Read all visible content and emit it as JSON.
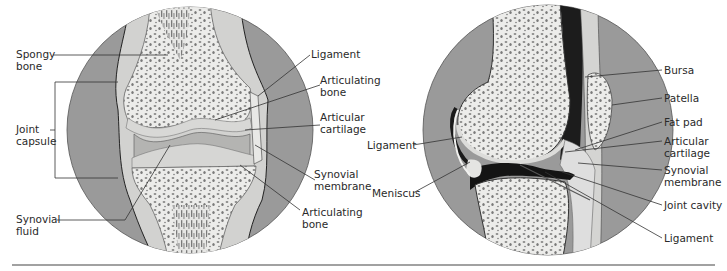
{
  "figure": {
    "left_panel": {
      "title": "Frontal view of synovial joint",
      "labels": {
        "spongy_bone": [
          "Spongy",
          "bone"
        ],
        "joint_capsule": [
          "Joint",
          "capsule"
        ],
        "synovial_fluid": [
          "Synovial",
          "fluid"
        ],
        "ligament": [
          "Ligament"
        ],
        "articulating_bone_top": [
          "Articulating",
          "bone"
        ],
        "articular_cartilage": [
          "Articular",
          "cartilage"
        ],
        "synovial_membrane": [
          "Synovial",
          "membrane"
        ],
        "articulating_bone_bottom": [
          "Articulating",
          "bone"
        ]
      }
    },
    "right_panel": {
      "title": "Sagittal view of knee joint",
      "labels": {
        "ligament_left": [
          "Ligament"
        ],
        "meniscus": [
          "Meniscus"
        ],
        "bursa": [
          "Bursa"
        ],
        "patella": [
          "Patella"
        ],
        "fat_pad": [
          "Fat pad"
        ],
        "articular_cartilage": [
          "Articular",
          "cartilage"
        ],
        "synovial_membrane": [
          "Synovial",
          "membrane"
        ],
        "joint_cavity": [
          "Joint cavity"
        ],
        "ligament_bottom": [
          "Ligament"
        ]
      }
    },
    "colors": {
      "background_circle": "#9a9a9a",
      "bone": "#ececea",
      "bone_pores": "#7d7d7d",
      "cartilage": "#d6d6d4",
      "dark_cavity": "#1a1a1a",
      "leader_line": "#333333",
      "text": "#2a2a2a",
      "baseline": "#444444"
    }
  }
}
